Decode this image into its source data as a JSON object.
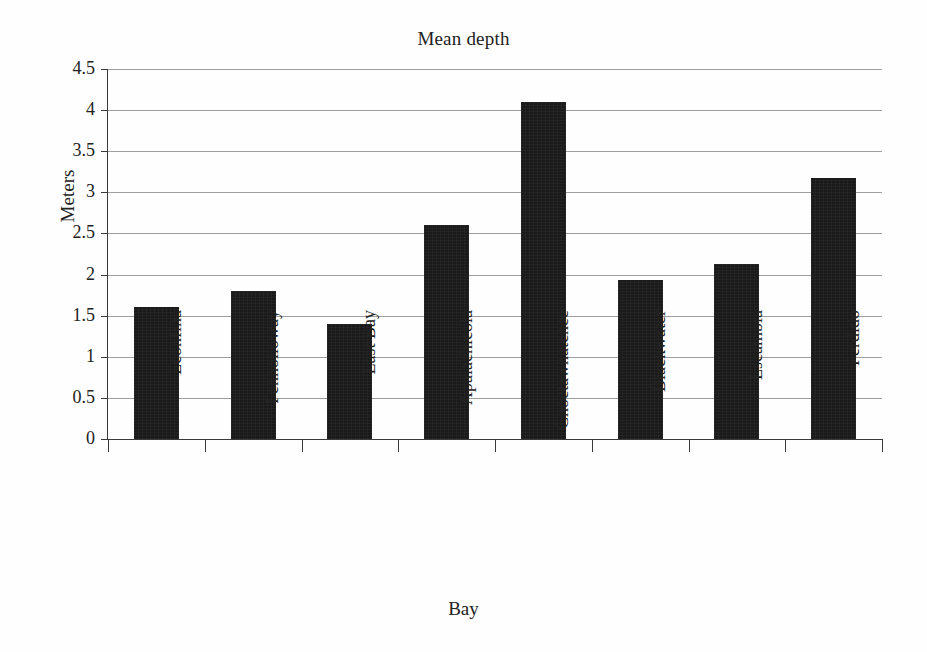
{
  "chart_data": {
    "type": "bar",
    "title": "Mean depth",
    "xlabel": "Bay",
    "ylabel": "Meters",
    "categories": [
      "Econfina",
      "Fenholloway",
      "East Bay",
      "Apalachicola",
      "Choctawhatchee",
      "Blackwater",
      "Escambia",
      "Perdido"
    ],
    "values": [
      1.6,
      1.8,
      1.4,
      2.6,
      4.1,
      1.93,
      2.13,
      3.18
    ],
    "ylim": [
      0,
      4.5
    ],
    "ytick_labels": [
      "0",
      "0.5",
      "1",
      "1.5",
      "2",
      "2.5",
      "3",
      "3.5",
      "4",
      "4.5"
    ],
    "ytick_values": [
      0,
      0.5,
      1,
      1.5,
      2,
      2.5,
      3,
      3.5,
      4,
      4.5
    ],
    "grid": true,
    "legend": "none",
    "series_color": "#1a1a1a",
    "gridline_color": "#8d8d8d",
    "axis_color": "#3a3a3a",
    "background": "#ffffff"
  }
}
